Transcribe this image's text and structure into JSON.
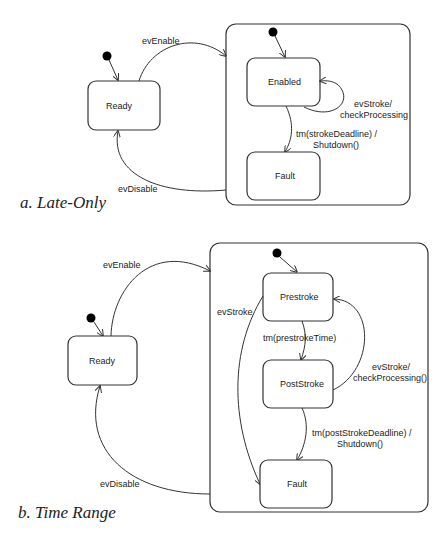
{
  "diagrams": [
    {
      "caption": "a. Late-Only",
      "states": {
        "ready": "Ready",
        "enabled": "Enabled",
        "fault": "Fault"
      },
      "transitions": {
        "enable": "evEnable",
        "disable": "evDisable",
        "self_stroke_line1": "evStroke/",
        "self_stroke_line2": "checkProcessing",
        "deadline_line1": "tm(strokeDeadline) /",
        "deadline_line2": "Shutdown()"
      }
    },
    {
      "caption": "b. Time Range",
      "states": {
        "ready": "Ready",
        "prestroke": "Prestroke",
        "poststroke": "PostStroke",
        "fault": "Fault"
      },
      "transitions": {
        "enable": "evEnable",
        "disable": "evDisable",
        "early_stroke": "evStroke",
        "prestroke_time": "tm(prestrokeTime)",
        "back_stroke_line1": "evStroke/",
        "back_stroke_line2": "checkProcessing()",
        "deadline_line1": "tm(postStrokeDeadline) /",
        "deadline_line2": "Shutdown()"
      }
    }
  ]
}
